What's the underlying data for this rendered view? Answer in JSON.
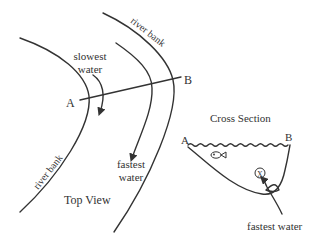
{
  "top_view": {
    "title": "Top View",
    "river_bank_top": "river bank",
    "river_bank_bottom": "river bank",
    "slowest_label_line1": "slowest",
    "slowest_label_line2": "water",
    "fastest_label_line1": "fastest",
    "fastest_label_line2": "water",
    "point_a": "A",
    "point_b": "B"
  },
  "cross_section": {
    "title": "Cross Section",
    "point_a": "A",
    "point_b": "B",
    "fastest_label": "fastest water",
    "marker": "X"
  },
  "colors": {
    "ink": "#333333",
    "background": "#ffffff"
  }
}
